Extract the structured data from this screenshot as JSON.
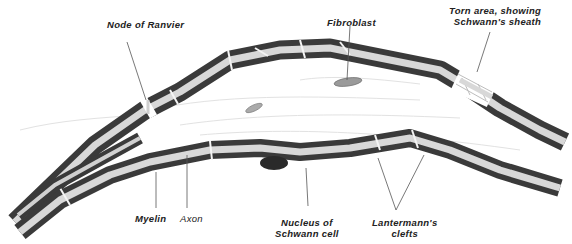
{
  "figure": {
    "colors": {
      "myelin": "#3a3a3a",
      "axon": "#d8d8d8",
      "sheath_outline": "#f4f4f4",
      "nucleus": "#2a2a2a",
      "fibroblast": "#9a9a9a",
      "leader_line": "#555555",
      "background": "#ffffff"
    }
  },
  "labels": {
    "node_of_ranvier": "Node of Ranvier",
    "fibroblast": "Fibroblast",
    "torn_area_line1": "Torn area, showing",
    "torn_area_line2": "Schwann's sheath",
    "myelin": "Myelin",
    "axon": "Axon",
    "nucleus_line1": "Nucleus of",
    "nucleus_line2": "Schwann cell",
    "lantermann_line1": "Lantermann's",
    "lantermann_line2": "clefts"
  }
}
